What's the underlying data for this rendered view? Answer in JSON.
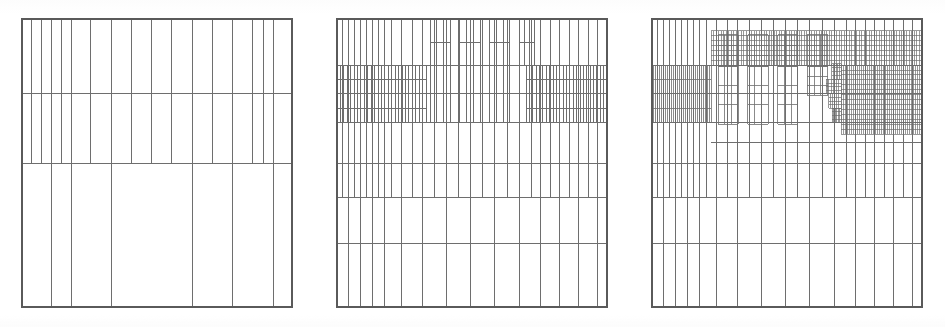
{
  "figure": {
    "title": "",
    "caption": "",
    "background_color": "#ffffff",
    "line_color": "#6e6e6e",
    "border_color": "#5a5a5a",
    "width": 945,
    "height": 327,
    "panel_count": 3,
    "kind": "adaptive-mesh-refinement-grid-sequence"
  },
  "chart_data": {
    "type": "line",
    "title": "",
    "subtitle": "",
    "xlabel": "",
    "ylabel": "",
    "grid": true,
    "legend_position": "none",
    "panels": [
      {
        "index": 0,
        "name": "panel-left",
        "label": "",
        "refinement_level": 1,
        "x": 22,
        "y": 19,
        "width": 270,
        "height": 288,
        "x_grid_normalized": [
          0.0,
          0.035,
          0.072,
          0.108,
          0.145,
          0.182,
          0.255,
          0.33,
          0.405,
          0.48,
          0.555,
          0.63,
          0.705,
          0.78,
          0.855,
          0.895,
          0.93,
          1.0
        ],
        "y_grid_normalized": [
          0.0,
          0.26,
          0.5,
          1.0
        ],
        "bands": [
          {
            "name": "top-band",
            "y0": 0.0,
            "y1": 0.26,
            "x_lines": [
              0.0,
              0.035,
              0.072,
              0.108,
              0.145,
              0.182,
              0.255,
              0.33,
              0.405,
              0.48,
              0.555,
              0.63,
              0.705,
              0.78,
              0.855,
              0.895,
              0.93,
              1.0
            ],
            "sub_rows": []
          },
          {
            "name": "mid-band",
            "y0": 0.26,
            "y1": 0.5,
            "x_lines": [
              0.0,
              0.035,
              0.072,
              0.108,
              0.145,
              0.182,
              0.255,
              0.33,
              0.405,
              0.48,
              0.555,
              0.63,
              0.705,
              0.78,
              0.855,
              0.895,
              0.93,
              1.0
            ],
            "sub_rows": []
          },
          {
            "name": "bottom-band",
            "y0": 0.5,
            "y1": 1.0,
            "x_lines": [
              0.0,
              0.108,
              0.182,
              0.33,
              0.63,
              0.78,
              0.93,
              1.0
            ],
            "sub_rows": []
          }
        ]
      },
      {
        "index": 1,
        "name": "panel-middle",
        "label": "",
        "refinement_level": 2,
        "x": 337,
        "y": 19,
        "width": 270,
        "height": 288,
        "x_grid_normalized": [
          0.0,
          0.022,
          0.044,
          0.066,
          0.088,
          0.11,
          0.133,
          0.155,
          0.177,
          0.2,
          0.24,
          0.28,
          0.315,
          0.36,
          0.405,
          0.45,
          0.495,
          0.54,
          0.585,
          0.63,
          0.675,
          0.72,
          0.755,
          0.79,
          0.825,
          0.86,
          0.895,
          0.93,
          0.965,
          1.0
        ],
        "y_grid_normalized": [
          0.0,
          0.16,
          0.26,
          0.36,
          0.5,
          0.62,
          0.78,
          1.0
        ],
        "bands": [
          {
            "name": "top-band",
            "y0": 0.0,
            "y1": 0.16,
            "x_lines": [
              0.0,
              0.022,
              0.044,
              0.066,
              0.088,
              0.11,
              0.133,
              0.155,
              0.177,
              0.2,
              0.24,
              0.28,
              0.315,
              0.36,
              0.405,
              0.45,
              0.495,
              0.54,
              0.585,
              0.63,
              0.675,
              0.72,
              0.755,
              0.79,
              0.825,
              0.86,
              0.895,
              0.93,
              0.965,
              1.0
            ],
            "sub_rows": [
              0.5
            ]
          },
          {
            "name": "dense-band-upper",
            "y0": 0.16,
            "y1": 0.26,
            "x_lines_dense": true,
            "dense_left_end": 0.33,
            "dense_right_start": 0.7,
            "sub_rows": [
              0.5
            ]
          },
          {
            "name": "dense-band-lower",
            "y0": 0.26,
            "y1": 0.36,
            "x_lines_dense": true,
            "dense_left_end": 0.33,
            "dense_right_start": 0.7,
            "sub_rows": [
              0.5
            ]
          },
          {
            "name": "mid-band-a",
            "y0": 0.36,
            "y1": 0.5,
            "x_lines": [
              0.0,
              0.022,
              0.044,
              0.066,
              0.088,
              0.11,
              0.133,
              0.155,
              0.177,
              0.2,
              0.24,
              0.28,
              0.315,
              0.36,
              0.405,
              0.45,
              0.495,
              0.54,
              0.585,
              0.63,
              0.675,
              0.72,
              0.755,
              0.79,
              0.825,
              0.86,
              0.895,
              0.93,
              0.965,
              1.0
            ],
            "sub_rows": []
          },
          {
            "name": "mid-band-b",
            "y0": 0.5,
            "y1": 0.62,
            "x_lines": [
              0.0,
              0.022,
              0.044,
              0.066,
              0.088,
              0.11,
              0.133,
              0.155,
              0.177,
              0.2,
              0.24,
              0.28,
              0.315,
              0.36,
              0.405,
              0.45,
              0.495,
              0.54,
              0.585,
              0.63,
              0.675,
              0.72,
              0.755,
              0.79,
              0.825,
              0.86,
              0.895,
              0.93,
              0.965,
              1.0
            ],
            "sub_rows": []
          },
          {
            "name": "lower-band",
            "y0": 0.62,
            "y1": 0.78,
            "x_lines": [
              0.0,
              0.044,
              0.088,
              0.133,
              0.177,
              0.24,
              0.315,
              0.405,
              0.495,
              0.585,
              0.675,
              0.755,
              0.825,
              0.895,
              0.965,
              1.0
            ],
            "sub_rows": []
          },
          {
            "name": "bottom-band",
            "y0": 0.78,
            "y1": 1.0,
            "x_lines": [
              0.0,
              0.044,
              0.088,
              0.133,
              0.177,
              0.24,
              0.315,
              0.405,
              0.495,
              0.585,
              0.675,
              0.755,
              0.825,
              0.895,
              0.965,
              1.0
            ],
            "sub_rows": []
          }
        ]
      },
      {
        "index": 2,
        "name": "panel-right",
        "label": "",
        "refinement_level": 3,
        "x": 652,
        "y": 19,
        "width": 270,
        "height": 288,
        "x_grid_normalized": [
          0.0,
          0.022,
          0.044,
          0.066,
          0.088,
          0.11,
          0.133,
          0.155,
          0.177,
          0.2,
          0.24,
          0.28,
          0.315,
          0.36,
          0.405,
          0.45,
          0.495,
          0.54,
          0.585,
          0.63,
          0.675,
          0.72,
          0.755,
          0.79,
          0.825,
          0.86,
          0.895,
          0.93,
          0.965,
          1.0
        ],
        "y_grid_normalized": [
          0.0,
          0.055,
          0.16,
          0.26,
          0.36,
          0.5,
          0.62,
          0.78,
          1.0
        ],
        "bands": [
          {
            "name": "hyper-dense-top-strip",
            "y0": 0.04,
            "y1": 0.16,
            "x0": 0.22,
            "x1": 1.0,
            "refinement": 4
          },
          {
            "name": "hyper-dense-right-block",
            "y0": 0.16,
            "y1": 0.4,
            "x0": 0.7,
            "x1": 1.0,
            "refinement": 4
          },
          {
            "name": "dense-band-left",
            "y0": 0.16,
            "y1": 0.36,
            "x0": 0.0,
            "x1": 0.22,
            "refinement": 3
          },
          {
            "name": "mid-band",
            "y0": 0.36,
            "y1": 0.5,
            "refinement": 2
          },
          {
            "name": "lower-band",
            "y0": 0.5,
            "y1": 0.62,
            "refinement": 2
          },
          {
            "name": "bottom-band-a",
            "y0": 0.62,
            "y1": 0.78,
            "refinement": 1
          },
          {
            "name": "bottom-band-b",
            "y0": 0.78,
            "y1": 1.0,
            "refinement": 1
          }
        ]
      }
    ]
  }
}
